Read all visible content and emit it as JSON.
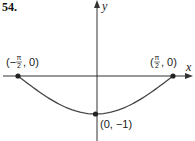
{
  "problem_number": "54.",
  "chart_data": {
    "type": "line",
    "title": "",
    "function": "y = -cos(x)",
    "xlabel": "x",
    "ylabel": "y",
    "xlim": [
      -1.5708,
      1.5708
    ],
    "ylim": [
      -1,
      0
    ],
    "grid": false,
    "series": [
      {
        "name": "curve",
        "x": [
          -1.5708,
          -1.1781,
          -0.7854,
          -0.3927,
          0,
          0.3927,
          0.7854,
          1.1781,
          1.5708
        ],
        "y": [
          0,
          -0.3827,
          -0.7071,
          -0.9239,
          -1,
          -0.9239,
          -0.7071,
          -0.3827,
          0
        ]
      }
    ],
    "points": [
      {
        "x": -1.5708,
        "y": 0,
        "label_open": "(−",
        "label_num": "π",
        "label_den": "2",
        "label_close": ", 0)"
      },
      {
        "x": 1.5708,
        "y": 0,
        "label_open": "(",
        "label_num": "π",
        "label_den": "2",
        "label_close": ", 0)"
      },
      {
        "x": 0,
        "y": -1,
        "label": "(0, −1)"
      }
    ]
  }
}
